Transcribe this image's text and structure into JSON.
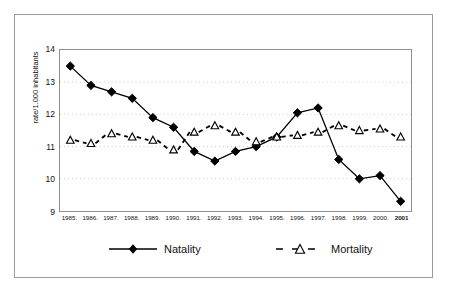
{
  "chart_data": {
    "type": "line",
    "title": "",
    "subtitle": "",
    "xlabel": "",
    "ylabel": "rate/1.000 inhabitants",
    "categories": [
      "1985.",
      "1986.",
      "1987.",
      "1988.",
      "1989.",
      "1990.",
      "1991.",
      "1992.",
      "1993.",
      "1994.",
      "1995.",
      "1996.",
      "1997.",
      "1998.",
      "1999.",
      "2000.",
      "2001"
    ],
    "ylim": [
      9,
      14
    ],
    "yticks": [
      9,
      10,
      11,
      12,
      13,
      14
    ],
    "ytick_labels": [
      "9",
      "10",
      "11",
      "12",
      "13",
      "14"
    ],
    "grid": true,
    "grid_style": "dotted-horizontal",
    "legend_position": "bottom",
    "series": [
      {
        "name": "Natality",
        "marker": "filled-diamond",
        "line_style": "solid",
        "color": "#000000",
        "values": [
          13.5,
          12.9,
          12.7,
          12.5,
          11.9,
          11.6,
          10.85,
          10.55,
          10.85,
          11.0,
          11.3,
          12.05,
          12.2,
          10.6,
          10.0,
          10.1,
          9.3
        ]
      },
      {
        "name": "Mortality",
        "marker": "open-triangle",
        "line_style": "dashed",
        "color": "#000000",
        "values": [
          11.2,
          11.1,
          11.4,
          11.3,
          11.2,
          10.9,
          11.45,
          11.65,
          11.45,
          11.15,
          11.3,
          11.35,
          11.45,
          11.65,
          11.5,
          11.55,
          11.3
        ]
      }
    ]
  },
  "legend": {
    "entries": [
      {
        "label": "Natality"
      },
      {
        "label": "Mortality"
      }
    ]
  },
  "colors": {
    "ink": "#000000",
    "frame": "#9a9a9a",
    "axis": "#8f8f8f",
    "grid": "#c8c8c8",
    "background": "#ffffff"
  }
}
